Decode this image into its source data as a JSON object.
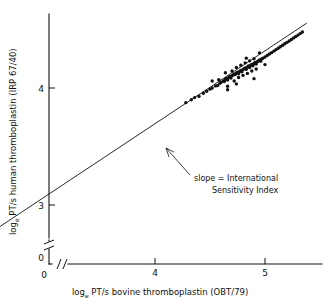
{
  "chart_data": {
    "type": "scatter",
    "title": "",
    "xlabel": "log_e PT/s  bovine thromboplastin  (OBT/79)",
    "ylabel": "log_e PT/s  human thromboplastin  (IRP 67/40)",
    "xlim": [
      2.0,
      5.45
    ],
    "ylim": [
      2.45,
      4.62
    ],
    "xticks": [
      4,
      5
    ],
    "yticks": [
      3,
      4
    ],
    "xtick_labels": [
      "4",
      "5"
    ],
    "ytick_labels": [
      "3",
      "4"
    ],
    "axis_origin_label_x": "0",
    "axis_origin_label_y": "0",
    "grid": false,
    "legend": "none",
    "axis_break_x": true,
    "axis_break_y": true,
    "marker": "filled-circle",
    "marker_color": "#111111",
    "line_color": "#111111",
    "annotations": [
      {
        "name": "slope-annotation",
        "line1": "slope = International",
        "line2": "Sensitivity Index",
        "points_to": [
          4.06,
          3.48
        ]
      }
    ],
    "fit_line": {
      "name": "orthogonal-regression-line",
      "x_start": 2.22,
      "y_start": 2.585,
      "x_end": 5.38,
      "y_end": 4.555
    },
    "series": [
      {
        "name": "calibration-points",
        "x": [
          2.24,
          2.27,
          2.3,
          2.3,
          2.32,
          2.33,
          2.34,
          2.35,
          2.35,
          2.36,
          2.37,
          2.38,
          2.38,
          2.39,
          2.4,
          2.41,
          2.42,
          2.43,
          2.44,
          2.45,
          2.47,
          2.5,
          2.53,
          4.28,
          4.33,
          4.36,
          4.4,
          4.44,
          4.47,
          4.5,
          4.52,
          4.55,
          4.57,
          4.59,
          4.6,
          4.62,
          4.63,
          4.64,
          4.65,
          4.66,
          4.67,
          4.68,
          4.69,
          4.7,
          4.71,
          4.72,
          4.73,
          4.74,
          4.75,
          4.76,
          4.77,
          4.78,
          4.79,
          4.8,
          4.81,
          4.82,
          4.83,
          4.84,
          4.85,
          4.86,
          4.87,
          4.88,
          4.89,
          4.9,
          4.91,
          4.92,
          4.93,
          4.94,
          4.95,
          4.96,
          4.97,
          4.98,
          5.0,
          5.02,
          5.04,
          5.06,
          5.08,
          5.1,
          5.12,
          5.14,
          5.16,
          5.18,
          5.2,
          5.22,
          5.24,
          5.26,
          5.28,
          5.3,
          5.32,
          5.34
        ],
        "y": [
          2.6,
          2.612,
          2.64,
          2.655,
          2.65,
          2.668,
          2.672,
          2.69,
          2.7,
          2.688,
          2.7,
          2.705,
          2.718,
          2.712,
          2.725,
          2.73,
          2.735,
          2.742,
          2.748,
          2.752,
          2.768,
          2.79,
          2.808,
          3.875,
          3.9,
          3.918,
          3.93,
          3.955,
          3.972,
          3.99,
          4.0,
          4.018,
          4.022,
          4.04,
          4.048,
          4.06,
          4.055,
          4.075,
          4.082,
          4.068,
          4.09,
          4.098,
          4.085,
          4.105,
          4.112,
          4.12,
          4.115,
          4.128,
          4.135,
          4.122,
          4.142,
          4.15,
          4.138,
          4.158,
          4.165,
          4.172,
          4.16,
          4.18,
          4.188,
          4.175,
          4.195,
          4.202,
          4.19,
          4.21,
          4.218,
          4.205,
          4.225,
          4.232,
          4.24,
          4.228,
          4.248,
          4.255,
          4.265,
          4.278,
          4.29,
          4.302,
          4.315,
          4.328,
          4.34,
          4.352,
          4.365,
          4.378,
          4.39,
          4.402,
          4.415,
          4.428,
          4.44,
          4.452,
          4.465,
          4.478
        ]
      },
      {
        "name": "scatter-offsets",
        "description": "vertical deviations applied to points to reproduce observed spread",
        "x": [
          4.52,
          4.58,
          4.64,
          4.66,
          4.7,
          4.72,
          4.74,
          4.76,
          4.78,
          4.8,
          4.82,
          4.84,
          4.86,
          4.88,
          4.9,
          4.92,
          4.66,
          4.74,
          4.83,
          4.9,
          4.95,
          5.0
        ],
        "y": [
          4.06,
          4.07,
          4.13,
          4.015,
          4.145,
          4.06,
          4.175,
          4.09,
          4.195,
          4.108,
          4.215,
          4.125,
          4.232,
          4.145,
          4.25,
          4.162,
          3.985,
          4.035,
          4.255,
          4.08,
          4.3,
          4.2
        ]
      }
    ]
  },
  "axis_labels": {
    "y_prefix": "log",
    "y_sub": "e",
    "y_rest": " PT/s  human thromboplastin  (IRP 67/40)",
    "x_prefix": "log",
    "x_sub": "e",
    "x_rest": " PT/s  bovine thromboplastin  (OBT/79)"
  }
}
